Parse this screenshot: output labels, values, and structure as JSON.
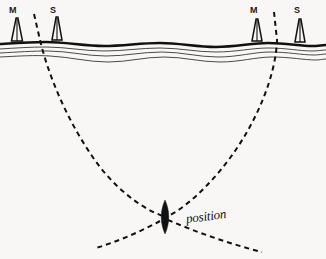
{
  "figure": {
    "kind": "hyperbolic-navigation-fix-diagram",
    "background_color": "#f8f7f5",
    "ink_color": "#111111"
  },
  "stations": [
    {
      "id": "left-master",
      "label": "M",
      "label_x": 9,
      "label_y": 6,
      "tower_x": 17,
      "base_y": 41,
      "top_y": 16,
      "half_width": 5.5,
      "role": "master"
    },
    {
      "id": "left-slave",
      "label": "S",
      "label_x": 50,
      "label_y": 6,
      "tower_x": 57,
      "base_y": 40,
      "top_y": 15,
      "half_width": 5.0,
      "role": "slave"
    },
    {
      "id": "right-master",
      "label": "M",
      "label_x": 250,
      "label_y": 6,
      "tower_x": 257,
      "base_y": 41,
      "top_y": 17,
      "half_width": 5.0,
      "role": "master"
    },
    {
      "id": "right-slave",
      "label": "S",
      "label_x": 294,
      "label_y": 6,
      "tower_x": 300,
      "base_y": 42,
      "top_y": 17,
      "half_width": 5.0,
      "role": "slave"
    }
  ],
  "coastline": {
    "thick_line": "M 0,44 C 16,43 30,42 46,42 C 66,42 84,46 104,46 C 124,46 140,43 160,43 C 180,43 196,47 216,47 C 236,47 252,43 268,43 C 286,43 300,46 312,46 C 318,46 322,45 326,45",
    "thin_lines": [
      "M 0,49 C 16,48 30,47 46,47 C 66,47 84,51 104,51 C 124,51 140,48 160,48 C 180,48 196,52 216,52 C 236,52 252,48 268,48 C 286,48 300,51 312,51 C 318,51 322,50 326,50",
      "M 0,53 C 18,52 32,51 48,51 C 68,51 86,56 106,56 C 126,56 142,52 162,52 C 182,52 198,57 218,57 C 238,57 254,52 270,52 C 288,52 302,55 314,55 C 319,55 323,54 326,54",
      "M 0,57 C 20,56 34,55 50,56 C 70,57 88,62 108,62 C 128,62 144,57 164,57 C 184,57 200,62 220,62 C 240,62 256,57 272,57 C 290,57 304,60 316,60 C 320,60 323,59 326,59"
    ]
  },
  "hyperbolic_lines": [
    {
      "id": "left-position-line",
      "pair": "left-master-slave",
      "dash_pattern": "5,4",
      "path": "M 34,14 L 40,40 C 48,74 66,118 92,156 C 112,186 140,208 163,216"
    },
    {
      "id": "left-position-line-extension",
      "pair": "left-master-slave",
      "dash_pattern": "5,4",
      "path": "M 168,220 C 196,232 230,244 262,252"
    },
    {
      "id": "right-position-line",
      "pair": "right-master-slave",
      "dash_pattern": "5,4",
      "path": "M 274,12 L 277,40 C 276,74 258,120 230,158 C 208,188 182,210 168,216"
    },
    {
      "id": "right-position-line-extension",
      "pair": "right-master-slave",
      "dash_pattern": "5,4",
      "path": "M 160,221 C 140,232 116,242 96,248"
    }
  ],
  "fix_marker": {
    "id": "position-fix",
    "shape": "lens",
    "cx": 165,
    "cy": 217,
    "half_width": 5,
    "half_height": 17,
    "fill": "#111111"
  },
  "annotations": {
    "position_label": {
      "text": "position",
      "x": 186,
      "y": 212
    }
  }
}
